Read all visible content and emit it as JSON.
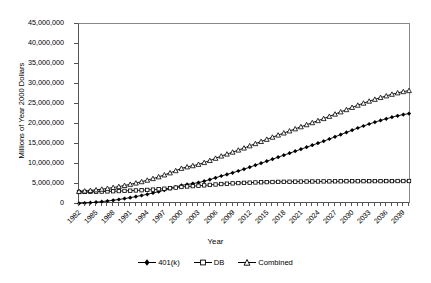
{
  "chart_data": {
    "type": "line",
    "title": "",
    "xlabel": "Year",
    "ylabel": "Millions of Year 2000 Dollars",
    "xlim": [
      1982,
      2040
    ],
    "ylim": [
      0,
      45000000
    ],
    "grid": false,
    "legend_position": "bottom",
    "y_ticks": [
      0,
      5000000,
      10000000,
      15000000,
      20000000,
      25000000,
      30000000,
      35000000,
      40000000,
      45000000
    ],
    "y_tick_labels": [
      "0",
      "5,000,000",
      "10,000,000",
      "15,000,000",
      "20,000,000",
      "25,000,000",
      "30,000,000",
      "35,000,000",
      "40,000,000",
      "45,000,000"
    ],
    "x_tick_labels": [
      "1982",
      "1985",
      "1988",
      "1991",
      "1994",
      "1997",
      "2000",
      "2003",
      "2006",
      "2009",
      "2012",
      "2015",
      "2018",
      "2021",
      "2024",
      "2027",
      "2030",
      "2033",
      "2036",
      "2039"
    ],
    "x": [
      1982,
      1983,
      1984,
      1985,
      1986,
      1987,
      1988,
      1989,
      1990,
      1991,
      1992,
      1993,
      1994,
      1995,
      1996,
      1997,
      1998,
      1999,
      2000,
      2001,
      2002,
      2003,
      2004,
      2005,
      2006,
      2007,
      2008,
      2009,
      2010,
      2011,
      2012,
      2013,
      2014,
      2015,
      2016,
      2017,
      2018,
      2019,
      2020,
      2021,
      2022,
      2023,
      2024,
      2025,
      2026,
      2027,
      2028,
      2029,
      2030,
      2031,
      2032,
      2033,
      2034,
      2035,
      2036,
      2037,
      2038,
      2039,
      2040
    ],
    "series": [
      {
        "name": "401(k)",
        "marker": "filled-diamond",
        "color": "#000000",
        "values": [
          150000,
          230000,
          330000,
          450000,
          590000,
          750000,
          930000,
          1130000,
          1350000,
          1590000,
          1850000,
          2130000,
          2430000,
          2750000,
          3090000,
          3450000,
          3830000,
          4230000,
          4650000,
          4900000,
          5100000,
          5350000,
          5700000,
          6100000,
          6550000,
          7000000,
          7400000,
          7800000,
          8250000,
          8700000,
          9200000,
          9700000,
          10200000,
          10700000,
          11200000,
          11700000,
          12200000,
          12700000,
          13200000,
          13700000,
          14200000,
          14700000,
          15200000,
          15700000,
          16250000,
          16800000,
          17350000,
          17900000,
          18450000,
          19000000,
          19500000,
          20000000,
          20450000,
          20900000,
          21300000,
          21700000,
          22050000,
          22350000,
          22600000
        ]
      },
      {
        "name": "DB",
        "marker": "open-square",
        "color": "#000000",
        "values": [
          3000000,
          3020000,
          3050000,
          3080000,
          3110000,
          3150000,
          3190000,
          3230000,
          3280000,
          3330000,
          3390000,
          3450000,
          3520000,
          3600000,
          3700000,
          3820000,
          3950000,
          4100000,
          4260000,
          4380000,
          4470000,
          4560000,
          4660000,
          4770000,
          4880000,
          4990000,
          5080000,
          5160000,
          5230000,
          5290000,
          5340000,
          5390000,
          5430000,
          5470000,
          5500000,
          5530000,
          5550000,
          5570000,
          5590000,
          5610000,
          5620000,
          5630000,
          5640000,
          5650000,
          5660000,
          5670000,
          5680000,
          5690000,
          5700000,
          5700000,
          5710000,
          5710000,
          5720000,
          5720000,
          5730000,
          5730000,
          5740000,
          5740000,
          5750000
        ]
      },
      {
        "name": "Combined",
        "marker": "open-triangle",
        "color": "#000000",
        "values": [
          3150000,
          3250000,
          3380000,
          3530000,
          3700000,
          3900000,
          4120000,
          4360000,
          4630000,
          4920000,
          5240000,
          5580000,
          5950000,
          6350000,
          6790000,
          7270000,
          7780000,
          8330000,
          8910000,
          9280000,
          9570000,
          9910000,
          10360000,
          10870000,
          11430000,
          11990000,
          12480000,
          12960000,
          13480000,
          13990000,
          14540000,
          15090000,
          15630000,
          16170000,
          16700000,
          17230000,
          17750000,
          18270000,
          18790000,
          19310000,
          19820000,
          20330000,
          20840000,
          21350000,
          21910000,
          22470000,
          23030000,
          23590000,
          24150000,
          24700000,
          25210000,
          25710000,
          26170000,
          26620000,
          27030000,
          27430000,
          27790000,
          28090000,
          28350000
        ]
      }
    ]
  },
  "legend": {
    "entries": [
      {
        "label": "401(k)"
      },
      {
        "label": "DB"
      },
      {
        "label": "Combined"
      }
    ]
  }
}
